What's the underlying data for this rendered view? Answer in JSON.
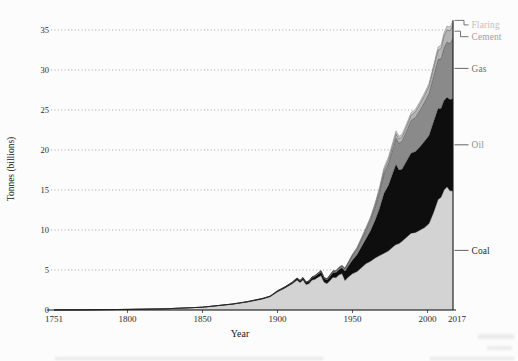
{
  "figure": {
    "background": "#fcfcfc",
    "axis_color": "#1a1a1a",
    "grid_color": "#999999",
    "tick_text_color": "#2b2b2b"
  },
  "chart_data": {
    "type": "area",
    "stacked": true,
    "title": "",
    "xlabel": "Year",
    "ylabel": "Tonnes (billions)",
    "xlim": [
      1751,
      2017
    ],
    "ylim": [
      0,
      36.5
    ],
    "yticks": [
      0,
      5,
      10,
      15,
      20,
      25,
      30,
      35
    ],
    "xticks": [
      1751,
      1800,
      1850,
      1900,
      1950,
      2000,
      2017
    ],
    "grid": "horizontal-dotted",
    "legend_position": "right-outside",
    "years": [
      1751,
      1775,
      1800,
      1825,
      1850,
      1860,
      1870,
      1880,
      1890,
      1895,
      1900,
      1905,
      1910,
      1913,
      1915,
      1917,
      1919,
      1921,
      1923,
      1925,
      1927,
      1929,
      1931,
      1933,
      1935,
      1937,
      1939,
      1941,
      1943,
      1945,
      1947,
      1950,
      1953,
      1956,
      1959,
      1962,
      1965,
      1968,
      1971,
      1974,
      1977,
      1979,
      1981,
      1983,
      1986,
      1989,
      1992,
      1995,
      1998,
      2001,
      2004,
      2007,
      2009,
      2011,
      2013,
      2015,
      2017
    ],
    "series": [
      {
        "name": "Coal",
        "fill": "#d3d3d3",
        "label_color": "#1f1f1f",
        "leader": "dash",
        "values": [
          0.01,
          0.03,
          0.08,
          0.15,
          0.35,
          0.54,
          0.73,
          1.0,
          1.38,
          1.65,
          2.28,
          2.75,
          3.3,
          3.75,
          3.45,
          3.78,
          3.2,
          3.3,
          3.75,
          3.85,
          4.1,
          4.3,
          3.5,
          3.3,
          3.7,
          4.1,
          4.05,
          4.4,
          4.55,
          3.7,
          4.1,
          4.55,
          4.8,
          5.3,
          5.8,
          6.1,
          6.5,
          6.8,
          7.1,
          7.4,
          7.9,
          8.2,
          8.3,
          8.6,
          9.1,
          9.6,
          9.7,
          10.0,
          10.3,
          10.8,
          12.2,
          13.8,
          14.1,
          15.0,
          15.4,
          14.9,
          14.9
        ]
      },
      {
        "name": "Oil",
        "fill": "#0e0e0e",
        "label_color": "#8f8f8f",
        "leader": "dash",
        "values": [
          0,
          0,
          0,
          0,
          0,
          0.01,
          0.02,
          0.04,
          0.05,
          0.06,
          0.08,
          0.11,
          0.15,
          0.18,
          0.18,
          0.2,
          0.22,
          0.25,
          0.28,
          0.32,
          0.38,
          0.45,
          0.42,
          0.44,
          0.5,
          0.58,
          0.62,
          0.68,
          0.72,
          1.15,
          1.35,
          1.7,
          2.1,
          2.6,
          3.1,
          3.8,
          4.7,
          5.9,
          7.5,
          8.2,
          9.3,
          10.0,
          9.2,
          9.0,
          9.5,
          10.0,
          10.1,
          10.4,
          10.8,
          11.0,
          11.3,
          11.4,
          11.1,
          11.2,
          11.2,
          11.4,
          11.5
        ]
      },
      {
        "name": "Gas",
        "fill": "#8a8a8a",
        "label_color": "#6f6f6f",
        "leader": "dash",
        "values": [
          0,
          0,
          0,
          0,
          0,
          0,
          0,
          0.01,
          0.02,
          0.02,
          0.04,
          0.04,
          0.05,
          0.07,
          0.07,
          0.07,
          0.08,
          0.08,
          0.09,
          0.1,
          0.11,
          0.13,
          0.12,
          0.12,
          0.14,
          0.16,
          0.18,
          0.2,
          0.22,
          0.3,
          0.35,
          0.55,
          0.7,
          0.85,
          1.05,
          1.3,
          1.6,
          2.0,
          2.45,
          2.75,
          3.0,
          3.3,
          3.35,
          3.5,
          3.75,
          4.1,
          4.3,
          4.6,
          4.9,
          5.3,
          5.7,
          6.1,
          6.2,
          6.6,
          6.9,
          7.0,
          7.6
        ]
      },
      {
        "name": "Cement",
        "fill": "#b4b4b4",
        "label_color": "#9e9e9e",
        "leader": "elbow",
        "values": [
          0,
          0,
          0,
          0,
          0,
          0,
          0,
          0,
          0,
          0,
          0,
          0,
          0,
          0,
          0,
          0,
          0,
          0.02,
          0.02,
          0.03,
          0.03,
          0.04,
          0.04,
          0.04,
          0.05,
          0.06,
          0.06,
          0.06,
          0.06,
          0.05,
          0.07,
          0.1,
          0.13,
          0.17,
          0.22,
          0.26,
          0.31,
          0.37,
          0.43,
          0.47,
          0.52,
          0.55,
          0.54,
          0.55,
          0.6,
          0.66,
          0.7,
          0.78,
          0.84,
          0.92,
          1.05,
          1.2,
          1.3,
          1.45,
          1.55,
          1.6,
          1.7
        ]
      },
      {
        "name": "Flaring",
        "fill": "#cfcfcf",
        "label_color": "#bfbfbf",
        "leader": "elbow-top",
        "values": [
          0,
          0,
          0,
          0,
          0,
          0,
          0,
          0,
          0,
          0,
          0,
          0,
          0,
          0,
          0,
          0,
          0,
          0,
          0,
          0,
          0,
          0,
          0,
          0,
          0,
          0,
          0,
          0.02,
          0.02,
          0.03,
          0.04,
          0.1,
          0.12,
          0.14,
          0.16,
          0.19,
          0.23,
          0.28,
          0.33,
          0.35,
          0.35,
          0.35,
          0.32,
          0.3,
          0.3,
          0.3,
          0.3,
          0.3,
          0.3,
          0.3,
          0.33,
          0.36,
          0.38,
          0.42,
          0.45,
          0.47,
          0.5
        ]
      }
    ]
  }
}
